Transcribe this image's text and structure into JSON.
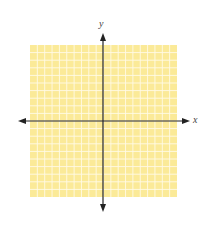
{
  "diagram": {
    "type": "coordinate-plane",
    "grid": {
      "left": 30,
      "top": 45,
      "right": 177,
      "bottom": 197,
      "cols": 20,
      "rows": 20,
      "fill": "#fbea98",
      "line_color": "#fffbe6"
    },
    "origin": {
      "x": 103,
      "y": 121
    },
    "x_axis": {
      "label": "x",
      "from": 18,
      "to": 190,
      "color": "#222222"
    },
    "y_axis": {
      "label": "y",
      "from": 33,
      "to": 212,
      "color": "#222222"
    }
  }
}
